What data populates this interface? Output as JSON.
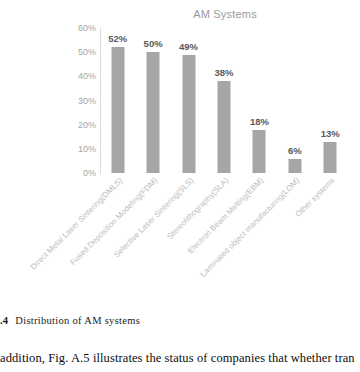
{
  "chart_data": {
    "type": "bar",
    "title": "AM Systems",
    "xlabel": "",
    "ylabel": "",
    "ylim": [
      0,
      60
    ],
    "ytick_labels": [
      "60%",
      "50%",
      "40%",
      "30%",
      "20%",
      "10%",
      "0%"
    ],
    "ytick_values": [
      60,
      50,
      40,
      30,
      20,
      10,
      0
    ],
    "grid": false,
    "legend": "none",
    "bar_color": "#a6a6a6",
    "categories": [
      "Direct Metal Laser Sintering(DMLS)",
      "Fused Deposition Modeling(FDM)",
      "Selective Laser Sintering(SLS)",
      "Stereolithography(SLA)",
      "Electron Beam Melting(EBM)",
      "Laminated object manufacturing(LOM)",
      "Other systems"
    ],
    "values": [
      52,
      50,
      49,
      38,
      18,
      6,
      13
    ],
    "data_labels": [
      "52%",
      "50%",
      "49%",
      "38%",
      "18%",
      "6%",
      "13%"
    ]
  },
  "caption": {
    "figure_number": ".4",
    "text": "Distribution of AM systems"
  },
  "body": {
    "paragraph": "addition, Fig. A.5 illustrates the status of companies that whether tran"
  }
}
